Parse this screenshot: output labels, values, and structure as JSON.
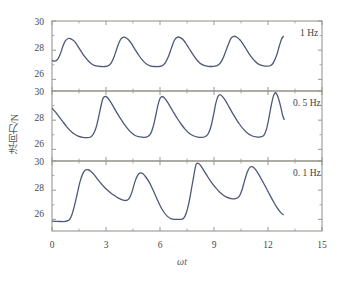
{
  "chart_data": {
    "type": "line",
    "title": "",
    "subtitle": "",
    "xlabel": "ωt",
    "ylabel": "法向力/N",
    "xlim": [
      0,
      15
    ],
    "xticks": [
      0,
      3,
      6,
      9,
      12,
      15
    ],
    "xtick_labels": [
      "0",
      "3",
      "6",
      "9",
      "12",
      "15"
    ],
    "minor_xticks": [
      1.5,
      4.5,
      7.5,
      10.5,
      13.5
    ],
    "grid": false,
    "legend_position": "inside-top-right",
    "panels": [
      {
        "name": "panel-1hz",
        "label": "1 Hz",
        "ylim": [
          25.2,
          30
        ],
        "yticks": [
          26,
          28,
          30
        ],
        "ytick_labels": [
          "26",
          "28",
          "30"
        ],
        "series_name": "normal force at 1 Hz",
        "points": [
          [
            0.0,
            27.3
          ],
          [
            0.15,
            27.25
          ],
          [
            0.3,
            27.35
          ],
          [
            0.45,
            27.7
          ],
          [
            0.6,
            28.25
          ],
          [
            0.75,
            28.65
          ],
          [
            0.9,
            28.8
          ],
          [
            1.05,
            28.78
          ],
          [
            1.25,
            28.6
          ],
          [
            1.45,
            28.25
          ],
          [
            1.65,
            27.85
          ],
          [
            1.85,
            27.5
          ],
          [
            2.05,
            27.22
          ],
          [
            2.25,
            27.02
          ],
          [
            2.45,
            26.92
          ],
          [
            2.7,
            26.88
          ],
          [
            2.95,
            26.88
          ],
          [
            3.15,
            26.95
          ],
          [
            3.3,
            27.15
          ],
          [
            3.45,
            27.55
          ],
          [
            3.6,
            28.1
          ],
          [
            3.75,
            28.6
          ],
          [
            3.9,
            28.85
          ],
          [
            4.05,
            28.88
          ],
          [
            4.25,
            28.72
          ],
          [
            4.45,
            28.38
          ],
          [
            4.65,
            27.98
          ],
          [
            4.85,
            27.6
          ],
          [
            5.05,
            27.28
          ],
          [
            5.25,
            27.05
          ],
          [
            5.45,
            26.93
          ],
          [
            5.7,
            26.88
          ],
          [
            5.95,
            26.88
          ],
          [
            6.15,
            26.95
          ],
          [
            6.3,
            27.15
          ],
          [
            6.48,
            27.6
          ],
          [
            6.65,
            28.2
          ],
          [
            6.8,
            28.68
          ],
          [
            6.95,
            28.88
          ],
          [
            7.1,
            28.88
          ],
          [
            7.3,
            28.7
          ],
          [
            7.5,
            28.35
          ],
          [
            7.7,
            27.95
          ],
          [
            7.9,
            27.58
          ],
          [
            8.1,
            27.26
          ],
          [
            8.3,
            27.04
          ],
          [
            8.55,
            26.92
          ],
          [
            8.8,
            26.88
          ],
          [
            9.05,
            26.9
          ],
          [
            9.25,
            27.0
          ],
          [
            9.42,
            27.25
          ],
          [
            9.6,
            27.75
          ],
          [
            9.78,
            28.35
          ],
          [
            9.95,
            28.82
          ],
          [
            10.1,
            28.95
          ],
          [
            10.25,
            28.9
          ],
          [
            10.45,
            28.7
          ],
          [
            10.65,
            28.35
          ],
          [
            10.85,
            27.95
          ],
          [
            11.05,
            27.58
          ],
          [
            11.25,
            27.28
          ],
          [
            11.45,
            27.06
          ],
          [
            11.7,
            26.94
          ],
          [
            11.95,
            26.9
          ],
          [
            12.15,
            26.95
          ],
          [
            12.3,
            27.15
          ],
          [
            12.48,
            27.65
          ],
          [
            12.62,
            28.25
          ],
          [
            12.75,
            28.75
          ],
          [
            12.85,
            28.95
          ]
        ]
      },
      {
        "name": "panel-0p5hz",
        "label": "0. 5 Hz",
        "ylim": [
          25.2,
          30
        ],
        "yticks": [
          26,
          28,
          30
        ],
        "ytick_labels": [
          "26",
          "28",
          "30"
        ],
        "series_name": "normal force at 0.5 Hz",
        "points": [
          [
            0.0,
            28.82
          ],
          [
            0.2,
            28.55
          ],
          [
            0.4,
            28.22
          ],
          [
            0.6,
            27.9
          ],
          [
            0.8,
            27.58
          ],
          [
            1.0,
            27.3
          ],
          [
            1.2,
            27.08
          ],
          [
            1.45,
            26.9
          ],
          [
            1.7,
            26.82
          ],
          [
            1.95,
            26.8
          ],
          [
            2.15,
            26.85
          ],
          [
            2.3,
            27.05
          ],
          [
            2.45,
            27.5
          ],
          [
            2.58,
            28.15
          ],
          [
            2.7,
            28.85
          ],
          [
            2.82,
            29.45
          ],
          [
            2.92,
            29.62
          ],
          [
            3.05,
            29.58
          ],
          [
            3.2,
            29.35
          ],
          [
            3.4,
            28.95
          ],
          [
            3.6,
            28.52
          ],
          [
            3.8,
            28.12
          ],
          [
            4.0,
            27.75
          ],
          [
            4.2,
            27.42
          ],
          [
            4.4,
            27.15
          ],
          [
            4.62,
            26.95
          ],
          [
            4.88,
            26.85
          ],
          [
            5.12,
            26.82
          ],
          [
            5.32,
            26.88
          ],
          [
            5.48,
            27.08
          ],
          [
            5.62,
            27.55
          ],
          [
            5.75,
            28.25
          ],
          [
            5.88,
            29.0
          ],
          [
            6.0,
            29.48
          ],
          [
            6.1,
            29.62
          ],
          [
            6.22,
            29.55
          ],
          [
            6.38,
            29.3
          ],
          [
            6.58,
            28.9
          ],
          [
            6.78,
            28.48
          ],
          [
            6.98,
            28.08
          ],
          [
            7.18,
            27.72
          ],
          [
            7.38,
            27.4
          ],
          [
            7.6,
            27.12
          ],
          [
            7.85,
            26.93
          ],
          [
            8.1,
            26.84
          ],
          [
            8.35,
            26.82
          ],
          [
            8.55,
            26.9
          ],
          [
            8.7,
            27.12
          ],
          [
            8.85,
            27.65
          ],
          [
            8.98,
            28.4
          ],
          [
            9.1,
            29.15
          ],
          [
            9.22,
            29.62
          ],
          [
            9.32,
            29.75
          ],
          [
            9.45,
            29.65
          ],
          [
            9.62,
            29.38
          ],
          [
            9.82,
            28.95
          ],
          [
            10.02,
            28.5
          ],
          [
            10.22,
            28.1
          ],
          [
            10.42,
            27.72
          ],
          [
            10.62,
            27.4
          ],
          [
            10.85,
            27.12
          ],
          [
            11.1,
            26.93
          ],
          [
            11.35,
            26.85
          ],
          [
            11.58,
            26.85
          ],
          [
            11.78,
            26.98
          ],
          [
            11.92,
            27.4
          ],
          [
            12.05,
            28.15
          ],
          [
            12.18,
            29.0
          ],
          [
            12.3,
            29.65
          ],
          [
            12.42,
            29.88
          ],
          [
            12.55,
            29.6
          ],
          [
            12.7,
            28.95
          ],
          [
            12.82,
            28.3
          ],
          [
            12.9,
            28.05
          ]
        ]
      },
      {
        "name": "panel-0p1hz",
        "label": "0. 1 Hz",
        "ylim": [
          25.2,
          30
        ],
        "yticks": [
          26,
          28,
          30
        ],
        "ytick_labels": [
          "26",
          "28",
          "30"
        ],
        "series_name": "normal force at 0.1 Hz",
        "points": [
          [
            0.0,
            25.88
          ],
          [
            0.25,
            25.86
          ],
          [
            0.5,
            25.85
          ],
          [
            0.75,
            25.86
          ],
          [
            0.95,
            25.95
          ],
          [
            1.1,
            26.3
          ],
          [
            1.25,
            26.95
          ],
          [
            1.4,
            27.75
          ],
          [
            1.55,
            28.55
          ],
          [
            1.7,
            29.1
          ],
          [
            1.85,
            29.38
          ],
          [
            2.0,
            29.4
          ],
          [
            2.15,
            29.3
          ],
          [
            2.35,
            29.05
          ],
          [
            2.55,
            28.72
          ],
          [
            2.75,
            28.42
          ],
          [
            2.95,
            28.15
          ],
          [
            3.2,
            27.88
          ],
          [
            3.45,
            27.65
          ],
          [
            3.7,
            27.45
          ],
          [
            3.95,
            27.32
          ],
          [
            4.15,
            27.3
          ],
          [
            4.3,
            27.45
          ],
          [
            4.45,
            27.9
          ],
          [
            4.6,
            28.55
          ],
          [
            4.75,
            29.0
          ],
          [
            4.9,
            29.18
          ],
          [
            5.05,
            29.12
          ],
          [
            5.2,
            28.92
          ],
          [
            5.4,
            28.55
          ],
          [
            5.6,
            28.05
          ],
          [
            5.8,
            27.5
          ],
          [
            6.0,
            26.95
          ],
          [
            6.2,
            26.52
          ],
          [
            6.4,
            26.22
          ],
          [
            6.6,
            26.05
          ],
          [
            6.85,
            26.0
          ],
          [
            7.1,
            26.0
          ],
          [
            7.3,
            26.05
          ],
          [
            7.45,
            26.4
          ],
          [
            7.6,
            27.1
          ],
          [
            7.75,
            28.1
          ],
          [
            7.9,
            29.15
          ],
          [
            8.0,
            29.75
          ],
          [
            8.1,
            29.85
          ],
          [
            8.25,
            29.7
          ],
          [
            8.45,
            29.32
          ],
          [
            8.65,
            28.92
          ],
          [
            8.85,
            28.55
          ],
          [
            9.05,
            28.22
          ],
          [
            9.25,
            27.95
          ],
          [
            9.45,
            27.72
          ],
          [
            9.7,
            27.52
          ],
          [
            9.95,
            27.42
          ],
          [
            10.2,
            27.42
          ],
          [
            10.4,
            27.58
          ],
          [
            10.55,
            28.0
          ],
          [
            10.7,
            28.65
          ],
          [
            10.85,
            29.25
          ],
          [
            11.0,
            29.58
          ],
          [
            11.15,
            29.6
          ],
          [
            11.3,
            29.42
          ],
          [
            11.5,
            29.05
          ],
          [
            11.7,
            28.6
          ],
          [
            11.9,
            28.15
          ],
          [
            12.1,
            27.68
          ],
          [
            12.3,
            27.22
          ],
          [
            12.5,
            26.8
          ],
          [
            12.7,
            26.48
          ],
          [
            12.85,
            26.32
          ]
        ]
      }
    ],
    "colors": {
      "curve": "#4d5878",
      "frame": "#9a9790",
      "tick_label": "#45484d",
      "axis_label": "#555a60",
      "background": "#ffffff"
    }
  }
}
